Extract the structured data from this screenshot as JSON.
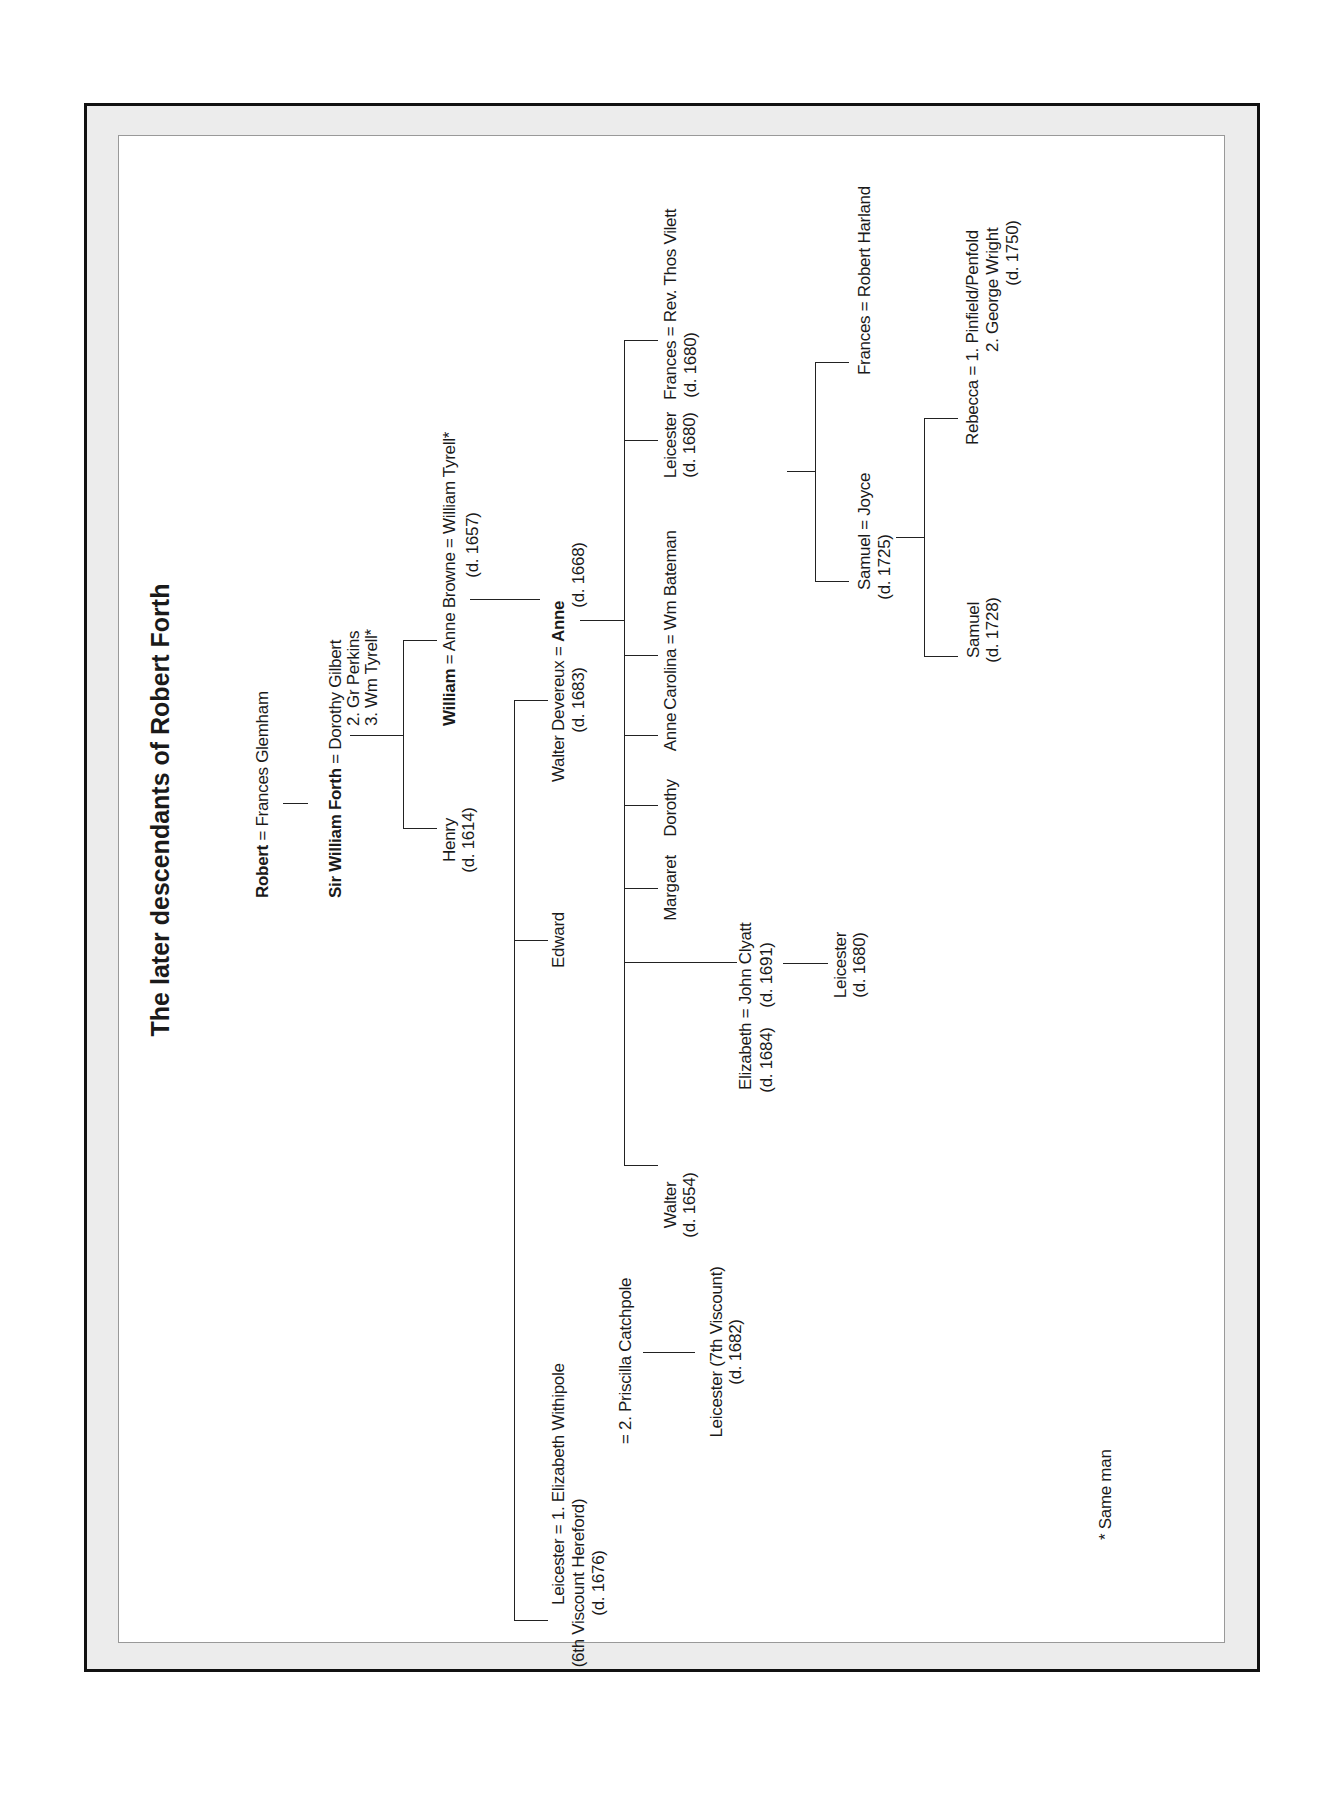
{
  "title": "The later descendants of Robert Forth",
  "generations": {
    "g1": {
      "husband": "Robert",
      "sep": " = ",
      "wife": "Frances Glemham"
    },
    "g2": {
      "husband": "Sir William Forth",
      "sep": " = ",
      "wife": "Dorothy Gilbert",
      "wife2": "2. Gr Perkins",
      "wife3": "3. Wm Tyrell*"
    },
    "g3": {
      "henry": {
        "name": "Henry",
        "dates": "(d. 1614)"
      },
      "william": {
        "name": "William",
        "sep": " = ",
        "wife": "Anne Browne",
        "sep2": " = ",
        "wife_husband2": "William Tyrell*",
        "wife_dates": "(d. 1657)"
      }
    },
    "g4": {
      "walter_devereux": {
        "name": "Walter Devereux",
        "dates": "(d. 1683)",
        "sep": " = ",
        "wife": "Anne",
        "wife_dates": "(d. 1668)"
      },
      "edward": {
        "name": "Edward"
      },
      "leicester": {
        "name": "Leicester",
        "sep": " = ",
        "wife1": "1. Elizabeth Withipole",
        "title": "(6th Viscount Hereford)",
        "dates": "(d. 1676)",
        "wife2": "= 2. Priscilla Catchpole"
      },
      "leicester7": {
        "name": "Leicester (7th Viscount)",
        "dates": "(d. 1682)"
      }
    },
    "g5": {
      "walter": {
        "name": "Walter",
        "dates": "(d. 1654)"
      },
      "elizabeth": {
        "name": "Elizabeth",
        "dates": "(d. 1684)",
        "sep": " = ",
        "husband": "John Clyatt",
        "husband_dates": "(d. 1691)"
      },
      "margaret": {
        "name": "Margaret"
      },
      "dorothy": {
        "name": "Dorothy"
      },
      "anne": {
        "name": "Anne"
      },
      "carolina": {
        "name": "Carolina = Wm Bateman"
      },
      "leicester": {
        "name": "Leicester",
        "dates": "(d. 1680)"
      },
      "frances": {
        "name": "Frances = Rev. Thos Vilett",
        "dates": "(d. 1680)"
      }
    },
    "cousins": {
      "dots_left": "......................",
      "label": "(cousins)",
      "dots_right": "...............................",
      "name": "Samuel Clyatt = Frances",
      "dates": "(d. 1693)"
    },
    "g6": {
      "leicester_clyatt": {
        "name": "Leicester",
        "dates": "(d. 1680)"
      },
      "samuel": {
        "name": "Samuel = Joyce",
        "dates": "(d. 1725)"
      },
      "frances": {
        "name": "Frances = Robert Harland"
      }
    },
    "g7": {
      "samuel": {
        "name": "Samuel",
        "dates": "(d. 1728)"
      },
      "rebecca": {
        "name": "Rebecca = 1. Pinfield/Penfold",
        "line2": "2. George Wright",
        "dates": "(d. 1750)"
      }
    }
  },
  "footnote": "* Same man"
}
